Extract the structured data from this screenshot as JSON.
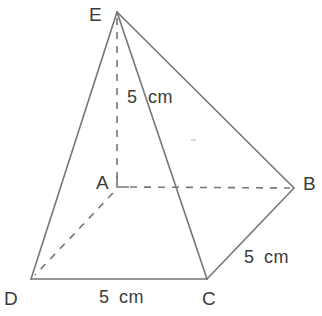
{
  "figure": {
    "type": "square-pyramid-geometry-diagram",
    "stroke_color": "#767676",
    "label_color": "#3b3b3b",
    "background_color": "#ffffff",
    "vertices": [
      {
        "name": "E",
        "label": "E",
        "x": 117,
        "y": 12,
        "label_x": 89,
        "label_y": 5,
        "role": "apex"
      },
      {
        "name": "A",
        "label": "A",
        "x": 117,
        "y": 187,
        "label_x": 96,
        "label_y": 173,
        "role": "base-center"
      },
      {
        "name": "B",
        "label": "B",
        "x": 294,
        "y": 188,
        "label_x": 303,
        "label_y": 174,
        "role": "base-corner"
      },
      {
        "name": "C",
        "label": "C",
        "x": 207,
        "y": 279,
        "label_x": 202,
        "label_y": 289,
        "role": "base-corner"
      },
      {
        "name": "D",
        "label": "D",
        "x": 31,
        "y": 279,
        "label_x": 4,
        "label_y": 289,
        "role": "base-corner"
      }
    ],
    "edges": [
      {
        "name": "edge-E-D",
        "from": "E",
        "to": "D",
        "style": "solid"
      },
      {
        "name": "edge-E-C",
        "from": "E",
        "to": "C",
        "style": "solid"
      },
      {
        "name": "edge-E-B",
        "from": "E",
        "to": "B",
        "style": "solid"
      },
      {
        "name": "edge-D-C",
        "from": "D",
        "to": "C",
        "style": "solid"
      },
      {
        "name": "edge-C-B",
        "from": "C",
        "to": "B",
        "style": "solid"
      },
      {
        "name": "edge-E-A",
        "from": "E",
        "to": "A",
        "style": "dashed",
        "meaning": "height"
      },
      {
        "name": "edge-A-B",
        "from": "A",
        "to": "B",
        "style": "dashed",
        "meaning": "hidden-base-diagonal"
      },
      {
        "name": "edge-A-D",
        "from": "A",
        "to": "D",
        "style": "dashed",
        "meaning": "hidden-base-diagonal"
      }
    ],
    "right_angle_marker": {
      "at": "A",
      "size": 11
    },
    "measurements": [
      {
        "name": "height-measure",
        "value": "5",
        "unit": "cm",
        "text": "5 cm",
        "value_x": 127,
        "value_y": 88,
        "unit_x": 148,
        "unit_y": 88,
        "edge": "E-A"
      },
      {
        "name": "slant-edge-measure",
        "value": "5",
        "unit": "cm",
        "text": "5 cm",
        "value_x": 244,
        "value_y": 248,
        "unit_x": 264,
        "unit_y": 248,
        "edge": "C-B"
      },
      {
        "name": "base-edge-measure",
        "value": "5",
        "unit": "cm",
        "text": "5 cm",
        "value_x": 99,
        "value_y": 288,
        "unit_x": 119,
        "unit_y": 288,
        "edge": "D-C"
      }
    ]
  }
}
